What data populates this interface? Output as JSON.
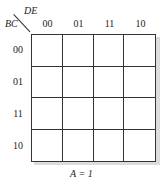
{
  "kmap": {
    "row_var": "BC",
    "col_var": "DE",
    "col_labels": [
      "00",
      "01",
      "11",
      "10"
    ],
    "row_labels": [
      "00",
      "01",
      "11",
      "10"
    ],
    "cells": [
      [
        "",
        "",
        "",
        ""
      ],
      [
        "",
        "",
        "",
        ""
      ],
      [
        "",
        "",
        "",
        ""
      ],
      [
        "",
        "",
        "",
        ""
      ]
    ],
    "caption": "A = 1"
  }
}
